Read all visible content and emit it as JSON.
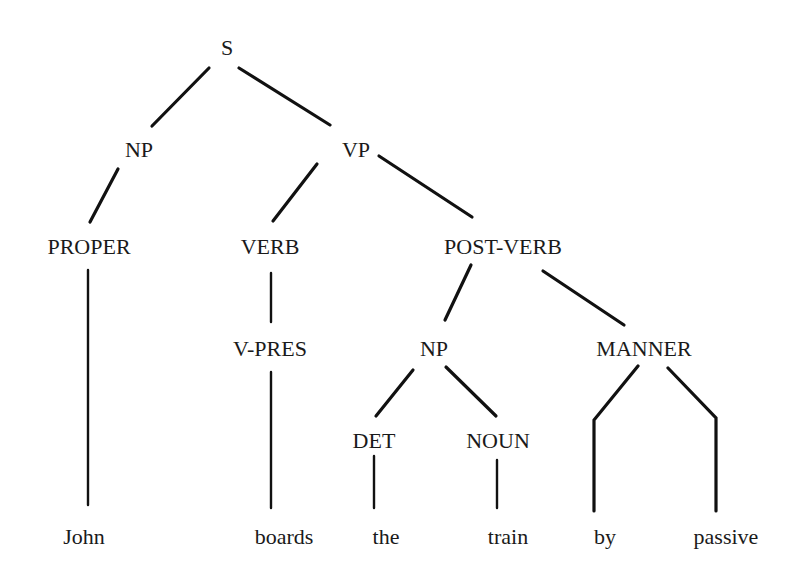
{
  "diagram": {
    "type": "parse-tree",
    "sentence": "John boards the train by passive",
    "nodes": {
      "s": "S",
      "np1": "NP",
      "vp": "VP",
      "proper": "PROPER",
      "verb": "VERB",
      "postverb": "POST-VERB",
      "vpres": "V-PRES",
      "np2": "NP",
      "manner": "MANNER",
      "det": "DET",
      "noun": "NOUN"
    },
    "leaves": {
      "john": "John",
      "boards": "boards",
      "the": "the",
      "train": "train",
      "by": "by",
      "passive": "passive"
    },
    "edges": [
      [
        "S",
        "NP"
      ],
      [
        "S",
        "VP"
      ],
      [
        "NP",
        "PROPER"
      ],
      [
        "PROPER",
        "John"
      ],
      [
        "VP",
        "VERB"
      ],
      [
        "VP",
        "POST-VERB"
      ],
      [
        "VERB",
        "V-PRES"
      ],
      [
        "V-PRES",
        "boards"
      ],
      [
        "POST-VERB",
        "NP"
      ],
      [
        "POST-VERB",
        "MANNER"
      ],
      [
        "NP",
        "DET"
      ],
      [
        "NP",
        "NOUN"
      ],
      [
        "DET",
        "the"
      ],
      [
        "NOUN",
        "train"
      ],
      [
        "MANNER",
        "by"
      ],
      [
        "MANNER",
        "passive"
      ]
    ],
    "colors": {
      "ink": "#111111",
      "background": "#ffffff"
    }
  }
}
